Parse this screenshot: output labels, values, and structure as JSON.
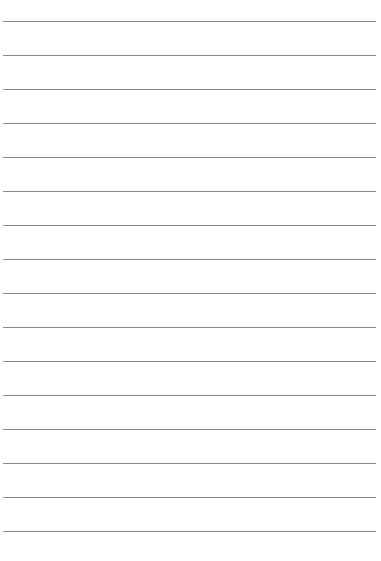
{
  "page": {
    "type": "lined-paper",
    "line_count": 16,
    "first_line_y": 21,
    "line_spacing": 34,
    "line_color": "#8a8a8a",
    "background_color": "#ffffff"
  }
}
